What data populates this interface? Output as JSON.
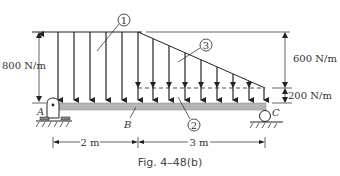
{
  "figure": {
    "caption": "Fig. 4–48(b)",
    "labels": {
      "load_left": "800 N/m",
      "load_right_top": "600 N/m",
      "load_right_bottom": "200 N/m",
      "point_a": "A",
      "point_b": "B",
      "point_c": "C",
      "dim_ab": "2 m",
      "dim_bc": "3 m",
      "region_1": "1",
      "region_2": "2",
      "region_3": "3"
    },
    "colors": {
      "line": "#222222",
      "beam_fill": "#b5b5b5",
      "text": "#333333"
    }
  }
}
